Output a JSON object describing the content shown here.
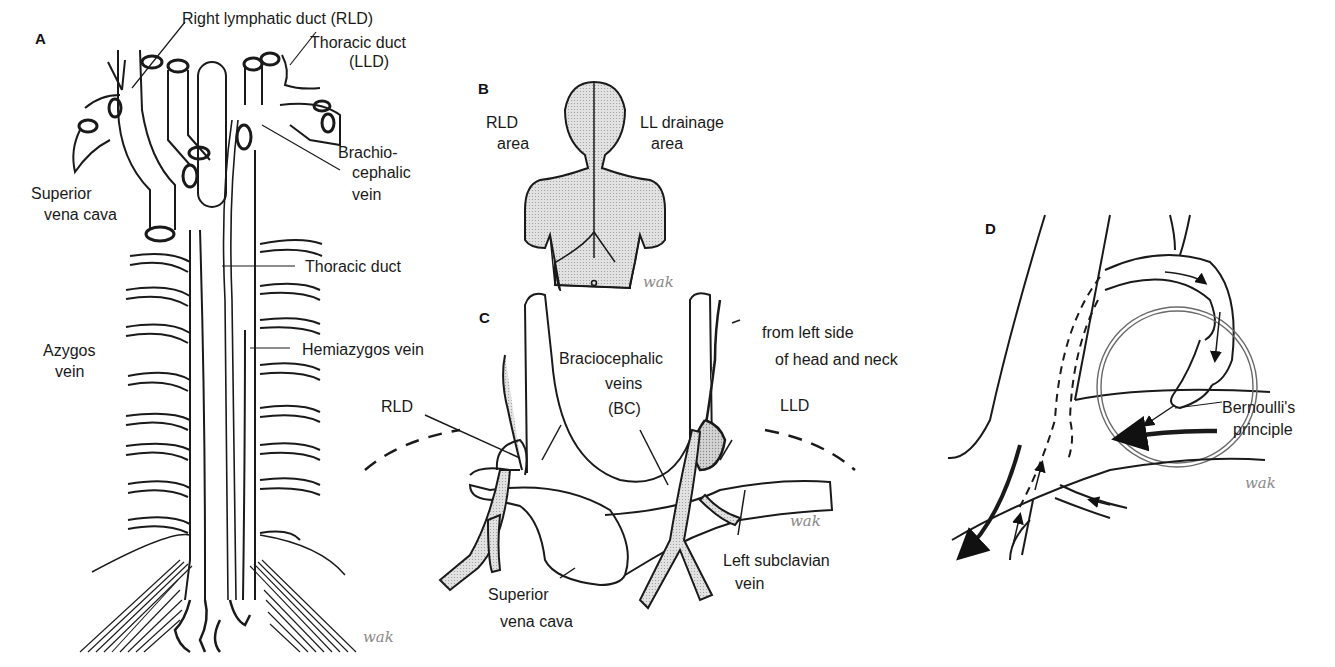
{
  "figure": {
    "panels": {
      "A": {
        "letter": "A",
        "labels": {
          "rld": "Right lymphatic duct (RLD)",
          "thoracic_duct_top_1": "Thoracic duct",
          "thoracic_duct_top_2": "(LLD)",
          "brachio_1": "Brachio-",
          "brachio_2": "cephalic",
          "brachio_3": "vein",
          "svc_1": "Superior",
          "svc_2": "vena cava",
          "thoracic_duct": "Thoracic duct",
          "hemiazygos": "Hemiazygos vein",
          "azygos_1": "Azygos",
          "azygos_2": "vein"
        },
        "signature": "wak"
      },
      "B": {
        "letter": "B",
        "labels": {
          "rld_1": "RLD",
          "rld_2": "area",
          "ll_1": "LL drainage",
          "ll_2": "area"
        },
        "signature": "wak"
      },
      "C": {
        "letter": "C",
        "labels": {
          "bc_1": "Braciocephalic",
          "bc_2": "veins",
          "bc_3": "(BC)",
          "from_1": "from left side",
          "from_2": "of head and neck",
          "rld": "RLD",
          "lld": "LLD",
          "lsv_1": "Left subclavian",
          "lsv_2": "vein",
          "svc_1": "Superior",
          "svc_2": "vena cava"
        },
        "signature": "wak"
      },
      "D": {
        "letter": "D",
        "labels": {
          "bern_1": "Bernoulli's",
          "bern_2": "principle"
        },
        "signature": "wak"
      }
    },
    "colors": {
      "ink": "#1a1a1a",
      "shade": "#c8c8c8",
      "signature": "#8a8a8a",
      "background": "#ffffff"
    }
  }
}
